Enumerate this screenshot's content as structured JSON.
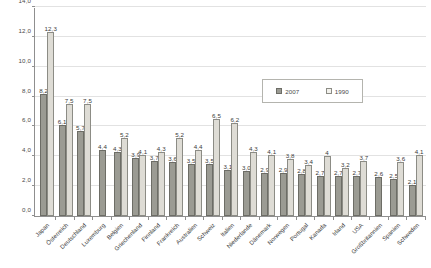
{
  "chart_data": {
    "type": "bar",
    "title": "",
    "xlabel": "",
    "ylabel": "",
    "ylim": [
      0.0,
      14.0
    ],
    "ytick_labels": [
      "0,0",
      "2,0",
      "4,0",
      "6,0",
      "8,0",
      "10,0",
      "12,0",
      "14,0"
    ],
    "ytick_values": [
      0,
      2,
      4,
      6,
      8,
      10,
      12,
      14
    ],
    "grid": true,
    "legend_position": "upper-right-inset",
    "categories": [
      "Japan",
      "Österreich",
      "Deutschland",
      "Luxemburg",
      "Belgien",
      "Griechenland",
      "Finnland",
      "Frankreich",
      "Australien",
      "Schweiz",
      "Italien",
      "Niederlande",
      "Dänemark",
      "Norwegen",
      "Portugal",
      "Kanada",
      "Irland",
      "USA",
      "Großbritannien",
      "Spanien",
      "Schweden"
    ],
    "series": [
      {
        "name": "2007",
        "color": "#9b9b93",
        "values": [
          8.2,
          6.1,
          5.7,
          4.4,
          4.3,
          3.9,
          3.7,
          3.6,
          3.5,
          3.5,
          3.1,
          3.0,
          2.9,
          2.9,
          2.8,
          2.7,
          2.7,
          2.7,
          2.6,
          2.5,
          2.1
        ],
        "labels": [
          "8,2",
          "6,1",
          "5,7",
          "4,4",
          "4,3",
          "3,9",
          "3,7",
          "3,6",
          "3,5",
          "3,5",
          "3,1",
          "3,0",
          "2,9",
          "2,9",
          "2,8",
          "2,7",
          "2,7",
          "2,7",
          "2,6",
          "2,5",
          "2,1"
        ]
      },
      {
        "name": "1990",
        "color": "#dedcd5",
        "values": [
          12.3,
          7.5,
          7.5,
          null,
          5.2,
          4.1,
          4.3,
          5.2,
          4.4,
          6.5,
          6.2,
          4.3,
          4.1,
          3.8,
          3.4,
          4.0,
          3.2,
          3.7,
          null,
          3.6,
          4.1
        ],
        "labels": [
          "12,3",
          "7,5",
          "7,5",
          "",
          "5,2",
          "4,1",
          "4,3",
          "5,2",
          "4,4",
          "6,5",
          "6,2",
          "4,3",
          "4,1",
          "3,8",
          "3,4",
          "4",
          "3,2",
          "3,7",
          "",
          "3,6",
          "4,1"
        ]
      }
    ]
  },
  "legend": {
    "items": [
      {
        "label": "2007",
        "swatch": "dark-gray-swatch"
      },
      {
        "label": "1990",
        "swatch": "light-gray-swatch"
      }
    ]
  }
}
